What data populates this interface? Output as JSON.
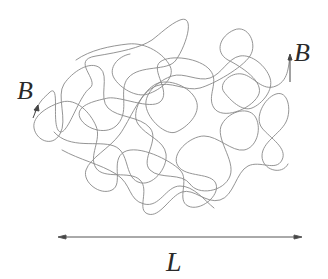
{
  "diagram": {
    "type": "random-coil-polymer",
    "colors": {
      "chain": "#7a7a7a",
      "arrow": "#555555",
      "text": "#2a2a2a",
      "background": "#ffffff"
    },
    "labels": {
      "left_end": "B",
      "right_end": "B",
      "length": "L"
    },
    "length_arrow": {
      "x_start": 60,
      "x_end": 300,
      "y": 237,
      "style": "double-headed"
    }
  }
}
